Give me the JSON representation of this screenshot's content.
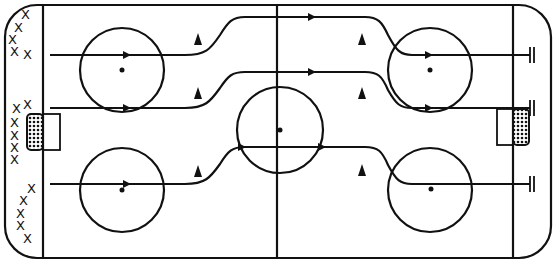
{
  "diagram": {
    "type": "hockey-rink-drill",
    "colors": {
      "ink": "#111111",
      "background": "#ffffff"
    },
    "players": {
      "symbol": "X",
      "groups": [
        {
          "name": "top-left",
          "count": 5,
          "positions": [
            [
              26,
              14
            ],
            [
              18,
              27
            ],
            [
              12,
              39
            ],
            [
              14,
              50
            ],
            [
              28,
              53
            ]
          ]
        },
        {
          "name": "middle-left",
          "count": 6,
          "positions": [
            [
              28,
              104
            ],
            [
              18,
              110
            ],
            [
              14,
              121
            ],
            [
              14,
              134
            ],
            [
              14,
              146
            ],
            [
              14,
              157
            ]
          ]
        },
        {
          "name": "bottom-left",
          "count": 5,
          "positions": [
            [
              32,
              189
            ],
            [
              24,
              201
            ],
            [
              20,
              214
            ],
            [
              20,
              226
            ],
            [
              28,
              238
            ]
          ]
        }
      ]
    },
    "cones": [
      [
        198,
        40
      ],
      [
        198,
        95
      ],
      [
        198,
        172
      ],
      [
        362,
        40
      ],
      [
        362,
        95
      ],
      [
        362,
        172
      ]
    ],
    "skating_paths": [
      {
        "name": "top-lane",
        "start_y": 55,
        "high_y": 17,
        "end": "double-bar"
      },
      {
        "name": "middle-lane",
        "start_y": 108,
        "high_y": 72,
        "end": "double-bar"
      },
      {
        "name": "bottom-lane",
        "start_y": 184,
        "high_y": 147,
        "end": "double-bar"
      }
    ],
    "faceoff_circles": [
      {
        "name": "left-top",
        "cx": 122,
        "cy": 70,
        "r": 42
      },
      {
        "name": "left-bottom",
        "cx": 122,
        "cy": 190,
        "r": 42
      },
      {
        "name": "center",
        "cx": 280,
        "cy": 130,
        "r": 43
      },
      {
        "name": "right-top",
        "cx": 430,
        "cy": 70,
        "r": 42
      },
      {
        "name": "right-bottom",
        "cx": 430,
        "cy": 190,
        "r": 42
      }
    ]
  }
}
